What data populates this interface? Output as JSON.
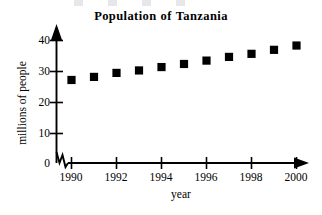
{
  "chart_data": {
    "type": "scatter",
    "xlabel": "year",
    "ylabel": "millions of people",
    "x": [
      1990,
      1991,
      1992,
      1993,
      1994,
      1995,
      1996,
      1997,
      1998,
      1999,
      2000
    ],
    "values": [
      27.0,
      28.0,
      29.3,
      30.1,
      31.2,
      32.2,
      33.3,
      34.5,
      35.5,
      36.8,
      38.2
    ],
    "series": [
      {
        "name": "Population of Tanzania",
        "values": [
          27.0,
          28.0,
          29.3,
          30.1,
          31.2,
          32.2,
          33.3,
          34.5,
          35.5,
          36.8,
          38.2
        ]
      }
    ],
    "xlim": [
      1990,
      2000
    ],
    "ylim": [
      0,
      42
    ],
    "xticks": [
      1990,
      1992,
      1994,
      1996,
      1998,
      2000
    ],
    "xtick_labels": [
      "1990",
      "1992",
      "1994",
      "1996",
      "1998",
      "2000"
    ],
    "yticks": [
      0,
      10,
      20,
      30,
      40
    ],
    "ytick_labels": [
      "0",
      "10",
      "20",
      "30",
      "40"
    ],
    "grid": false,
    "legend": false,
    "marker": "filled-square",
    "marker_color": "#000000",
    "axis_color": "#000000",
    "axis_break": true,
    "axis_arrows": [
      "x-right",
      "y-up"
    ]
  },
  "title_parts": [
    "Population",
    "of",
    "Tanzania"
  ]
}
